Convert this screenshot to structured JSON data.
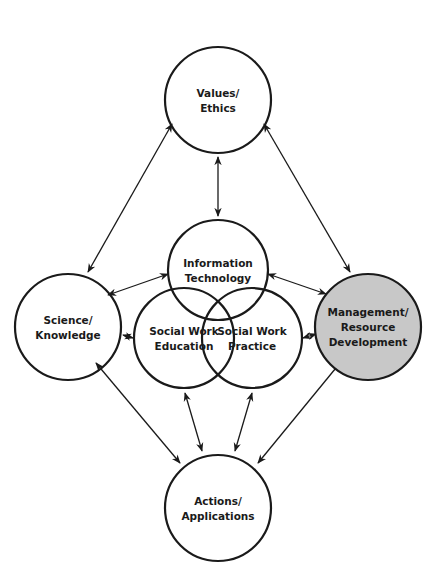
{
  "diagram": {
    "type": "concept-map",
    "colors": {
      "stroke": "#1a1a1a",
      "background": "#ffffff",
      "highlight_fill": "#c8c8c8"
    },
    "nodes": [
      {
        "id": "values",
        "lines": [
          "Values/",
          "Ethics"
        ],
        "cx": 218,
        "cy": 100,
        "r": 53,
        "highlighted": false
      },
      {
        "id": "infotech",
        "lines": [
          "Information",
          "Technology"
        ],
        "cx": 218,
        "cy": 270,
        "r": 50,
        "highlighted": false
      },
      {
        "id": "swed",
        "lines": [
          "Social Work",
          "Education"
        ],
        "cx": 184,
        "cy": 338,
        "r": 50,
        "highlighted": false
      },
      {
        "id": "swprac",
        "lines": [
          "Social Work",
          "Practice"
        ],
        "cx": 252,
        "cy": 338,
        "r": 50,
        "highlighted": false
      },
      {
        "id": "science",
        "lines": [
          "Science/",
          "Knowledge"
        ],
        "cx": 68,
        "cy": 327,
        "r": 53,
        "highlighted": false
      },
      {
        "id": "mgmt",
        "lines": [
          "Management/",
          "Resource",
          "Development"
        ],
        "cx": 368,
        "cy": 327,
        "r": 53,
        "highlighted": true
      },
      {
        "id": "actions",
        "lines": [
          "Actions/",
          "Applications"
        ],
        "cx": 218,
        "cy": 508,
        "r": 53,
        "highlighted": false
      }
    ],
    "edges": [
      {
        "from": "values",
        "to": "infotech",
        "x1": 218,
        "y1": 157,
        "x2": 218,
        "y2": 216
      },
      {
        "from": "values",
        "to": "science",
        "x1": 172,
        "y1": 124,
        "x2": 88,
        "y2": 272
      },
      {
        "from": "values",
        "to": "mgmt",
        "x1": 264,
        "y1": 124,
        "x2": 350,
        "y2": 272
      },
      {
        "from": "science",
        "to": "infotech",
        "x1": 108,
        "y1": 295,
        "x2": 168,
        "y2": 274
      },
      {
        "from": "infotech",
        "to": "mgmt",
        "x1": 268,
        "y1": 274,
        "x2": 326,
        "y2": 294
      },
      {
        "from": "science",
        "to": "swed",
        "x1": 123,
        "y1": 335,
        "x2": 133,
        "y2": 338
      },
      {
        "from": "swprac",
        "to": "mgmt",
        "x1": 303,
        "y1": 338,
        "x2": 316,
        "y2": 334
      },
      {
        "from": "science",
        "to": "actions",
        "x1": 96,
        "y1": 363,
        "x2": 180,
        "y2": 463
      },
      {
        "from": "swed",
        "to": "actions",
        "x1": 185,
        "y1": 393,
        "x2": 202,
        "y2": 451
      },
      {
        "from": "swprac",
        "to": "actions",
        "x1": 252,
        "y1": 393,
        "x2": 235,
        "y2": 451
      },
      {
        "from": "mgmt",
        "to": "actions",
        "x1": 340,
        "y1": 363,
        "x2": 258,
        "y2": 463
      }
    ]
  }
}
